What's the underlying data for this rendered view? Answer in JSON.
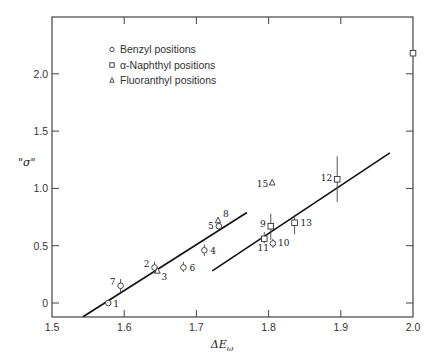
{
  "chart_data": {
    "type": "scatter",
    "title": "",
    "xlabel": "ΔE_ω",
    "ylabel": "\"σ\"",
    "xlim": [
      1.5,
      2.0
    ],
    "ylim": [
      -0.12,
      2.5
    ],
    "xticks": [
      1.5,
      1.6,
      1.7,
      1.8,
      1.9,
      2.0
    ],
    "xtick_labels": [
      "1.5",
      "1.6",
      "1.7",
      "1.8",
      "1.9",
      "2.0"
    ],
    "yticks": [
      0,
      0.5,
      1.0,
      1.5,
      2.0
    ],
    "ytick_labels": [
      "0",
      "0.5",
      "1.0",
      "1.5",
      "2.0"
    ],
    "grid": false,
    "legend_position": "upper left (inside)",
    "legend": [
      {
        "marker": "circle",
        "label": "Benzyl positions"
      },
      {
        "marker": "square",
        "label": "α-Naphthyl positions"
      },
      {
        "marker": "triangle",
        "label": "Fluoranthyl positions"
      }
    ],
    "series": [
      {
        "name": "Benzyl positions",
        "marker": "circle",
        "points": [
          {
            "id": "1",
            "x": 1.578,
            "y": 0.0
          },
          {
            "id": "7",
            "x": 1.595,
            "y": 0.15
          },
          {
            "id": "2",
            "x": 1.642,
            "y": 0.31
          },
          {
            "id": "6",
            "x": 1.682,
            "y": 0.31
          },
          {
            "id": "4",
            "x": 1.711,
            "y": 0.46
          },
          {
            "id": "5",
            "x": 1.731,
            "y": 0.67
          },
          {
            "id": "10",
            "x": 1.806,
            "y": 0.52
          }
        ]
      },
      {
        "name": "α-Naphthyl positions",
        "marker": "square",
        "points": [
          {
            "id": "11",
            "x": 1.794,
            "y": 0.56
          },
          {
            "id": "9",
            "x": 1.803,
            "y": 0.67
          },
          {
            "id": "13",
            "x": 1.836,
            "y": 0.7
          },
          {
            "id": "12",
            "x": 1.895,
            "y": 1.08
          },
          {
            "id": "",
            "x": 2.0,
            "y": 2.18
          }
        ]
      },
      {
        "name": "Fluoranthyl positions",
        "marker": "triangle",
        "points": [
          {
            "id": "3",
            "x": 1.646,
            "y": 0.28
          },
          {
            "id": "8",
            "x": 1.73,
            "y": 0.72
          },
          {
            "id": "15",
            "x": 1.805,
            "y": 1.05
          }
        ]
      }
    ],
    "fit_lines": [
      {
        "x": [
          1.543,
          1.77
        ],
        "y": [
          -0.12,
          0.79
        ]
      },
      {
        "x": [
          1.722,
          1.968
        ],
        "y": [
          0.28,
          1.31
        ]
      }
    ]
  },
  "labels": {
    "ylabel": "\"σ\"",
    "xlabel_main": "ΔE",
    "xlabel_sub": "ω"
  }
}
